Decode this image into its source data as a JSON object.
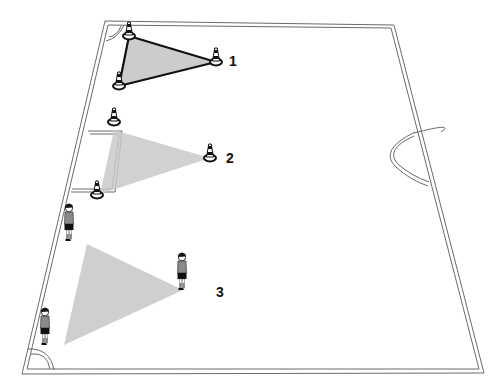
{
  "diagram": {
    "type": "soccer-drill-field",
    "colors": {
      "background": "#ffffff",
      "field_line": "#6b6b6b",
      "zone_fill": "#c8c8c8",
      "zone_outline": "#111111",
      "cone_stripe": "#111111",
      "player_shirt": "#8a8a8a",
      "player_shorts": "#111111"
    },
    "zones": [
      {
        "id": "1",
        "label": "1",
        "outlined": true
      },
      {
        "id": "2",
        "label": "2",
        "outlined": false
      },
      {
        "id": "3",
        "label": "3",
        "outlined": false
      }
    ]
  }
}
